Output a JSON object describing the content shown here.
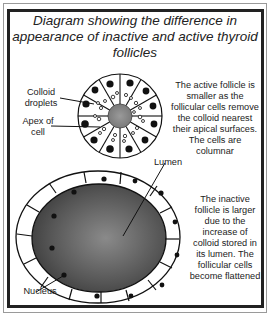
{
  "title": "Diagram showing the difference in appearance of inactive and active thyroid follicles",
  "active_follicle": {
    "description": "The active follicle is smaller as the follicular cells remove the colloid nearest their apical surfaces. The cells are columnar",
    "labels": {
      "colloid_droplets": "Colloid droplets",
      "apex_of_cell": "Apex of cell"
    }
  },
  "inactive_follicle": {
    "description": "The inactive follicle is larger due to the increase of colloid stored in its lumen. The follicular cells become flattened",
    "labels": {
      "lumen": "Lumen",
      "nucleus": "Nucleus"
    }
  }
}
